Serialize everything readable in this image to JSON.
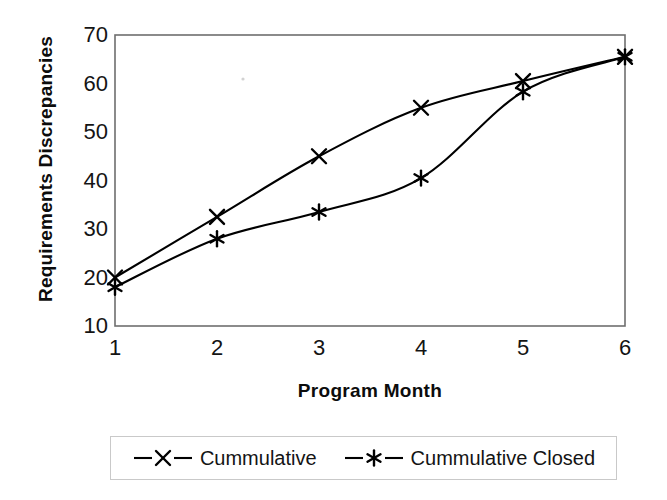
{
  "chart_data": {
    "type": "line",
    "title": "",
    "xlabel": "Program Month",
    "ylabel": "Requirements Discrepancies",
    "x": [
      1,
      2,
      3,
      4,
      5,
      6
    ],
    "xtick_labels": [
      "1",
      "2",
      "3",
      "4",
      "5",
      "6"
    ],
    "ytick_labels": [
      "70",
      "60",
      "50",
      "40",
      "30",
      "20",
      "10"
    ],
    "xlim": [
      1,
      6
    ],
    "ylim": [
      10,
      70
    ],
    "grid": false,
    "legend_position": "bottom",
    "series": [
      {
        "name": "Cummulative",
        "marker": "x-marker",
        "color": "#000000",
        "values": [
          20,
          32.5,
          45,
          55,
          60.5,
          65.5
        ]
      },
      {
        "name": "Cummulative Closed",
        "marker": "asterisk-marker",
        "color": "#000000",
        "values": [
          18,
          28,
          33.5,
          40.5,
          58.3,
          65.5
        ]
      }
    ]
  },
  "axes": {
    "y_title": "Requirements Discrepancies",
    "x_title": "Program Month",
    "y_ticks": [
      {
        "label": "70",
        "value": 70
      },
      {
        "label": "60",
        "value": 60
      },
      {
        "label": "50",
        "value": 50
      },
      {
        "label": "40",
        "value": 40
      },
      {
        "label": "30",
        "value": 30
      },
      {
        "label": "20",
        "value": 20
      },
      {
        "label": "10",
        "value": 10
      }
    ],
    "x_ticks": [
      {
        "label": "1",
        "value": 1
      },
      {
        "label": "2",
        "value": 2
      },
      {
        "label": "3",
        "value": 3
      },
      {
        "label": "4",
        "value": 4
      },
      {
        "label": "5",
        "value": 5
      },
      {
        "label": "6",
        "value": 6
      }
    ],
    "frame_color": "#6e6e6e"
  },
  "legend": {
    "entries": [
      {
        "label": "Cummulative",
        "marker": "x-marker"
      },
      {
        "label": "Cummulative Closed",
        "marker": "asterisk-marker"
      }
    ]
  }
}
